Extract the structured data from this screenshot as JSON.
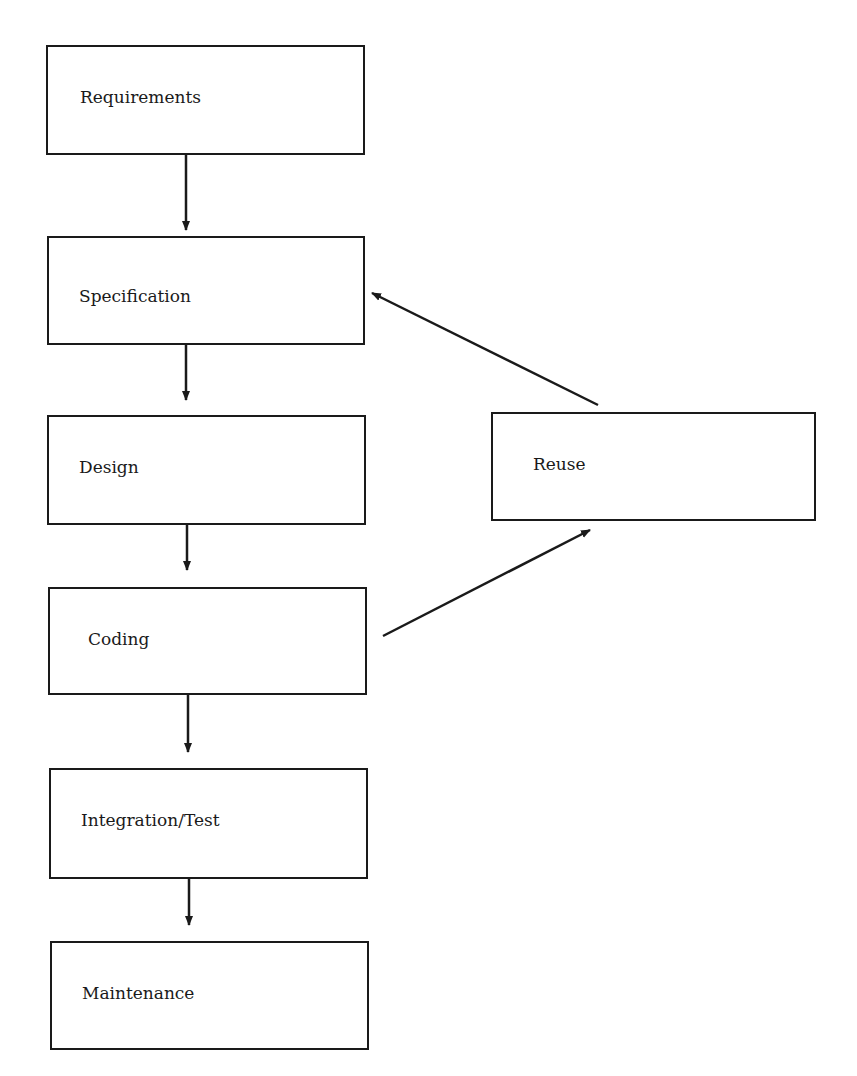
{
  "diagram": {
    "type": "flowchart",
    "nodes": [
      {
        "id": "requirements",
        "label": "Requirements",
        "x": 46,
        "y": 45,
        "w": 319,
        "h": 110,
        "lx": 32,
        "ly": 42
      },
      {
        "id": "specification",
        "label": "Specification",
        "x": 47,
        "y": 236,
        "w": 318,
        "h": 109,
        "lx": 30,
        "ly": 50
      },
      {
        "id": "design",
        "label": "Design",
        "x": 47,
        "y": 415,
        "w": 319,
        "h": 110,
        "lx": 30,
        "ly": 42
      },
      {
        "id": "coding",
        "label": "Coding",
        "x": 48,
        "y": 587,
        "w": 319,
        "h": 108,
        "lx": 38,
        "ly": 42
      },
      {
        "id": "integration_test",
        "label": "Integration/Test",
        "x": 49,
        "y": 768,
        "w": 319,
        "h": 111,
        "lx": 30,
        "ly": 42
      },
      {
        "id": "maintenance",
        "label": "Maintenance",
        "x": 50,
        "y": 941,
        "w": 319,
        "h": 109,
        "lx": 30,
        "ly": 42
      },
      {
        "id": "reuse",
        "label": "Reuse",
        "x": 491,
        "y": 412,
        "w": 325,
        "h": 109,
        "lx": 40,
        "ly": 42
      }
    ],
    "edges": [
      {
        "from": "requirements",
        "to": "specification",
        "x1": 186,
        "y1": 155,
        "x2": 186,
        "y2": 230
      },
      {
        "from": "specification",
        "to": "design",
        "x1": 186,
        "y1": 345,
        "x2": 186,
        "y2": 400
      },
      {
        "from": "design",
        "to": "coding",
        "x1": 187,
        "y1": 525,
        "x2": 187,
        "y2": 570
      },
      {
        "from": "coding",
        "to": "integration_test",
        "x1": 188,
        "y1": 695,
        "x2": 188,
        "y2": 752
      },
      {
        "from": "integration_test",
        "to": "maintenance",
        "x1": 189,
        "y1": 879,
        "x2": 189,
        "y2": 925
      },
      {
        "from": "coding",
        "to": "reuse",
        "x1": 383,
        "y1": 636,
        "x2": 590,
        "y2": 530
      },
      {
        "from": "reuse",
        "to": "specification",
        "x1": 598,
        "y1": 405,
        "x2": 372,
        "y2": 293
      }
    ],
    "colors": {
      "stroke": "#1a1a1a",
      "background": "#ffffff"
    }
  }
}
